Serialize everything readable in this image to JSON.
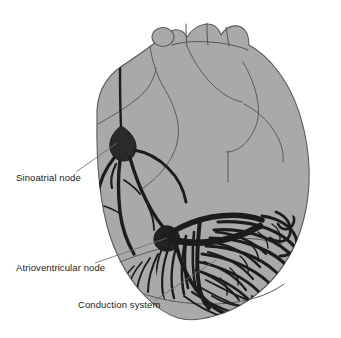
{
  "figure": {
    "background_color": "#ffffff"
  },
  "colors": {
    "background": "#ffffff",
    "myocardium_fill": "#a9a9a9",
    "myocardium_fill_light": "#b3b3b3",
    "outline": "#5a5a5a",
    "conduction_fiber": "#1c1c1c",
    "node_fill": "#2a2a2a",
    "leader_line": "#6e6e6e",
    "label_text": "#1a1a1a"
  },
  "labels": [
    {
      "id": "sinoatrial-node",
      "text": "Sinoatrial node",
      "text_x": 16,
      "text_y": 181,
      "leader": {
        "x1": 76,
        "y1": 172,
        "x2": 117,
        "y2": 143
      }
    },
    {
      "id": "atrioventricular-node",
      "text": "Atrioventricular node",
      "text_x": 16,
      "text_y": 271,
      "leader": {
        "x1": 95,
        "y1": 263,
        "x2": 167,
        "y2": 238
      }
    },
    {
      "id": "conduction-system",
      "text": "Conduction system",
      "text_x": 78,
      "text_y": 308,
      "leader": {
        "x1": 155,
        "y1": 300,
        "x2": 216,
        "y2": 260
      }
    }
  ],
  "anatomy": {
    "great_vessels": "Aortic arch with brachiocephalic, carotid and subclavian branches at superior border",
    "chambers": [
      "right atrium",
      "left atrium",
      "right ventricle",
      "left ventricle"
    ],
    "conduction_parts": [
      "sinoatrial node",
      "internodal atrial pathways",
      "atrioventricular node",
      "bundle of His",
      "left bundle branch",
      "right bundle branch",
      "Purkinje fiber network"
    ]
  }
}
